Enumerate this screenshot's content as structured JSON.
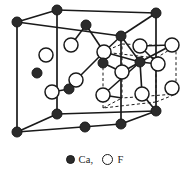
{
  "figure": {
    "name": "fluorite-unit-cell",
    "background_color": "#ffffff",
    "line_color": "#1a1a1a",
    "ca_fill": "#2b2b2b",
    "f_fill": "#ffffff"
  },
  "legend": {
    "items": [
      {
        "label": "Ca,",
        "swatch": "filled-circle-icon",
        "kind": "ca"
      },
      {
        "label": "F",
        "swatch": "open-circle-icon",
        "kind": "f"
      }
    ]
  },
  "chart_data": {
    "type": "scatter",
    "title": "",
    "xlabel": "",
    "ylabel": "",
    "cell_outline": {
      "style": "solid",
      "vertices": {
        "front_top_left": [
          17,
          22
        ],
        "front_top_right": [
          121,
          36
        ],
        "front_bot_left": [
          17,
          132
        ],
        "front_bot_right": [
          121,
          124
        ],
        "back_top_left": [
          57,
          10
        ],
        "back_top_right": [
          156,
          13
        ],
        "back_bot_left": [
          57,
          114
        ],
        "back_bot_right": [
          156,
          111
        ]
      },
      "edges": [
        [
          "front_top_left",
          "front_top_right"
        ],
        [
          "front_top_right",
          "front_bot_right"
        ],
        [
          "front_bot_right",
          "front_bot_left"
        ],
        [
          "front_bot_left",
          "front_top_left"
        ],
        [
          "back_top_left",
          "back_top_right"
        ],
        [
          "back_top_right",
          "back_bot_right"
        ],
        [
          "back_bot_right",
          "back_bot_left"
        ],
        [
          "back_bot_left",
          "back_top_left"
        ],
        [
          "front_top_left",
          "back_top_left"
        ],
        [
          "front_top_right",
          "back_top_right"
        ],
        [
          "front_bot_left",
          "back_bot_left"
        ],
        [
          "front_bot_right",
          "back_bot_right"
        ]
      ]
    },
    "sub_cube": {
      "style": "dashed",
      "note": "octant sub-cube showing tetrahedral Ca-F coordination",
      "vertices": {
        "f_tl": [
          103,
          52
        ],
        "f_tr": [
          156,
          58
        ],
        "f_bl": [
          103,
          108
        ],
        "f_br": [
          156,
          102
        ],
        "b_tl": [
          122,
          44
        ],
        "b_tr": [
          176,
          46
        ],
        "b_bl": [
          122,
          98
        ],
        "b_br": [
          176,
          94
        ]
      },
      "edges": [
        [
          "f_tl",
          "f_tr"
        ],
        [
          "f_tr",
          "f_br"
        ],
        [
          "f_br",
          "f_bl"
        ],
        [
          "f_bl",
          "f_tl"
        ],
        [
          "b_tl",
          "b_tr"
        ],
        [
          "b_tr",
          "b_br"
        ],
        [
          "b_br",
          "b_bl"
        ],
        [
          "b_bl",
          "b_tl"
        ],
        [
          "f_tl",
          "b_tl"
        ],
        [
          "f_tr",
          "b_tr"
        ],
        [
          "f_bl",
          "b_bl"
        ],
        [
          "f_br",
          "b_br"
        ]
      ]
    },
    "atoms": {
      "ca": {
        "series_name": "Ca",
        "radius": 5.0,
        "points": [
          [
            17,
            22
          ],
          [
            57,
            10
          ],
          [
            121,
            36
          ],
          [
            156,
            13
          ],
          [
            17,
            132
          ],
          [
            57,
            114
          ],
          [
            121,
            124
          ],
          [
            156,
            111
          ],
          [
            37,
            73
          ],
          [
            86,
            25
          ],
          [
            85,
            127
          ],
          [
            140,
            62
          ],
          [
            103,
            63
          ],
          [
            69,
            89
          ]
        ]
      },
      "f": {
        "series_name": "F",
        "radius": 7.0,
        "points": [
          [
            46,
            55
          ],
          [
            71,
            45
          ],
          [
            104,
            52
          ],
          [
            140,
            46
          ],
          [
            172,
            45
          ],
          [
            52,
            92
          ],
          [
            76,
            80
          ],
          [
            103,
            95
          ],
          [
            142,
            94
          ],
          [
            172,
            88
          ],
          [
            122,
            72
          ],
          [
            158,
            64
          ]
        ]
      }
    },
    "bonds": [
      [
        [
          86,
          25
        ],
        [
          104,
          52
        ]
      ],
      [
        [
          86,
          25
        ],
        [
          71,
          45
        ]
      ],
      [
        [
          121,
          36
        ],
        [
          104,
          52
        ]
      ],
      [
        [
          104,
          52
        ],
        [
          76,
          80
        ]
      ],
      [
        [
          76,
          80
        ],
        [
          69,
          89
        ]
      ],
      [
        [
          69,
          89
        ],
        [
          52,
          92
        ]
      ],
      [
        [
          140,
          62
        ],
        [
          122,
          72
        ]
      ],
      [
        [
          140,
          62
        ],
        [
          104,
          52
        ]
      ],
      [
        [
          140,
          62
        ],
        [
          158,
          64
        ]
      ],
      [
        [
          140,
          62
        ],
        [
          142,
          94
        ]
      ],
      [
        [
          140,
          62
        ],
        [
          103,
          95
        ]
      ],
      [
        [
          140,
          62
        ],
        [
          172,
          45
        ]
      ],
      [
        [
          140,
          62
        ],
        [
          121,
          36
        ]
      ],
      [
        [
          103,
          63
        ],
        [
          104,
          52
        ]
      ],
      [
        [
          103,
          63
        ],
        [
          122,
          72
        ]
      ],
      [
        [
          140,
          46
        ],
        [
          172,
          45
        ]
      ],
      [
        [
          140,
          46
        ],
        [
          158,
          64
        ]
      ],
      [
        [
          103,
          95
        ],
        [
          122,
          98
        ]
      ],
      [
        [
          142,
          94
        ],
        [
          156,
          111
        ]
      ]
    ]
  }
}
